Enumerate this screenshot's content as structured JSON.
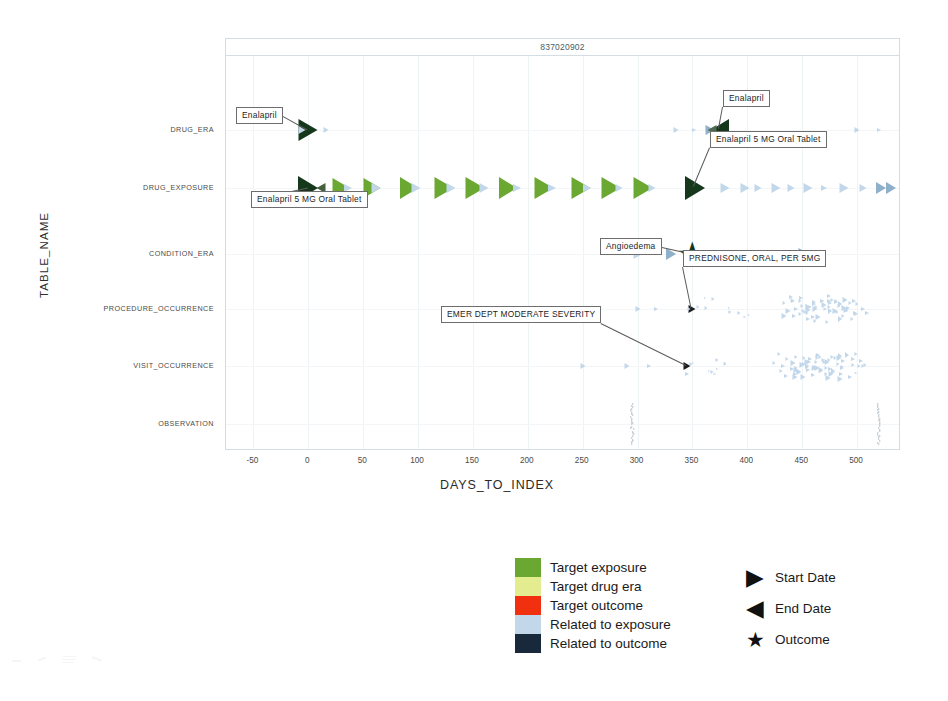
{
  "chart_data": {
    "type": "scatter",
    "title": "837020902",
    "xlabel": "DAYS_TO_INDEX",
    "ylabel": "TABLE_NAME",
    "xlim": [
      -75,
      540
    ],
    "xticks": [
      -50,
      0,
      50,
      100,
      150,
      200,
      250,
      300,
      350,
      400,
      450,
      500
    ],
    "categories": [
      "DRUG_ERA",
      "DRUG_EXPOSURE",
      "CONDITION_ERA",
      "PROCEDURE_OCCURRENCE",
      "VISIT_OCCURRENCE",
      "OBSERVATION"
    ],
    "grid": true,
    "legend_position": "below-center",
    "colors": {
      "target_exposure": "#6aa832",
      "target_drug_era": "#e4ec90",
      "target_outcome": "#f0300f",
      "related_to_exposure": "#c3d7ea",
      "related_to_outcome": "#17293a",
      "dark_marker": "#15381c"
    },
    "series": [
      {
        "name": "DRUG_ERA",
        "row": "DRUG_ERA",
        "points": [
          {
            "x": 0,
            "shape": "start",
            "color": "#15381c",
            "size": 19
          },
          {
            "x": -6,
            "shape": "start",
            "color": "#c3d7ea",
            "size": 7
          },
          {
            "x": 16,
            "shape": "start",
            "color": "#c3d7ea",
            "size": 5
          },
          {
            "x": 335,
            "shape": "start",
            "color": "#c3d7ea",
            "size": 5
          },
          {
            "x": 351,
            "shape": "start",
            "color": "#c3d7ea",
            "size": 4
          },
          {
            "x": 366,
            "shape": "start",
            "color": "#8fb0c9",
            "size": 9
          },
          {
            "x": 375,
            "shape": "end",
            "color": "#15381c",
            "size": 18
          },
          {
            "x": 368,
            "shape": "end",
            "color": "#516a52",
            "size": 9
          },
          {
            "x": 500,
            "shape": "start",
            "color": "#c3d7ea",
            "size": 5
          },
          {
            "x": 520,
            "shape": "start",
            "color": "#c3d7ea",
            "size": 4
          }
        ]
      },
      {
        "name": "DRUG_EXPOSURE",
        "row": "DRUG_EXPOSURE",
        "points": [
          {
            "x": 0,
            "shape": "start",
            "color": "#15381c",
            "size": 20
          },
          {
            "x": 12,
            "shape": "end",
            "color": "#46603f",
            "size": 9
          },
          {
            "x": 30,
            "shape": "start",
            "color": "#6aa832",
            "size": 17
          },
          {
            "x": 36,
            "shape": "start",
            "color": "#c3d7ea",
            "size": 8
          },
          {
            "x": 58,
            "shape": "start",
            "color": "#6aa832",
            "size": 17
          },
          {
            "x": 62,
            "shape": "start",
            "color": "#c3d7ea",
            "size": 9
          },
          {
            "x": 92,
            "shape": "start",
            "color": "#6aa832",
            "size": 18
          },
          {
            "x": 98,
            "shape": "start",
            "color": "#c3d7ea",
            "size": 9
          },
          {
            "x": 124,
            "shape": "start",
            "color": "#6aa832",
            "size": 19
          },
          {
            "x": 130,
            "shape": "start",
            "color": "#c3d7ea",
            "size": 9
          },
          {
            "x": 152,
            "shape": "start",
            "color": "#6aa832",
            "size": 19
          },
          {
            "x": 160,
            "shape": "start",
            "color": "#c3d7ea",
            "size": 9
          },
          {
            "x": 182,
            "shape": "start",
            "color": "#6aa832",
            "size": 18
          },
          {
            "x": 190,
            "shape": "start",
            "color": "#c3d7ea",
            "size": 8
          },
          {
            "x": 215,
            "shape": "start",
            "color": "#6aa832",
            "size": 19
          },
          {
            "x": 222,
            "shape": "start",
            "color": "#c3d7ea",
            "size": 8
          },
          {
            "x": 248,
            "shape": "start",
            "color": "#6aa832",
            "size": 19
          },
          {
            "x": 254,
            "shape": "start",
            "color": "#c3d7ea",
            "size": 8
          },
          {
            "x": 276,
            "shape": "start",
            "color": "#6aa832",
            "size": 19
          },
          {
            "x": 283,
            "shape": "start",
            "color": "#c3d7ea",
            "size": 7
          },
          {
            "x": 305,
            "shape": "start",
            "color": "#6aa832",
            "size": 19
          },
          {
            "x": 313,
            "shape": "start",
            "color": "#c3d7ea",
            "size": 7
          },
          {
            "x": 352,
            "shape": "start",
            "color": "#15381c",
            "size": 20
          },
          {
            "x": 380,
            "shape": "start",
            "color": "#c3d7ea",
            "size": 9
          },
          {
            "x": 398,
            "shape": "start",
            "color": "#c3d7ea",
            "size": 9
          },
          {
            "x": 410,
            "shape": "start",
            "color": "#c3d7ea",
            "size": 7
          },
          {
            "x": 426,
            "shape": "start",
            "color": "#c3d7ea",
            "size": 9
          },
          {
            "x": 440,
            "shape": "start",
            "color": "#c3d7ea",
            "size": 7
          },
          {
            "x": 455,
            "shape": "start",
            "color": "#c3d7ea",
            "size": 9
          },
          {
            "x": 470,
            "shape": "start",
            "color": "#c3d7ea",
            "size": 6
          },
          {
            "x": 488,
            "shape": "start",
            "color": "#c3d7ea",
            "size": 9
          },
          {
            "x": 505,
            "shape": "start",
            "color": "#c3d7ea",
            "size": 7
          },
          {
            "x": 522,
            "shape": "start",
            "color": "#8fb0c9",
            "size": 10
          },
          {
            "x": 531,
            "shape": "start",
            "color": "#8fb0c9",
            "size": 10
          }
        ]
      },
      {
        "name": "CONDITION_ERA",
        "row": "CONDITION_ERA",
        "points": [
          {
            "x": 300,
            "shape": "start",
            "color": "#c3d7ea",
            "size": 9
          },
          {
            "x": 330,
            "shape": "start",
            "color": "#8fb0c9",
            "size": 10
          },
          {
            "x": 350,
            "shape": "outcome",
            "color": "#15381c",
            "size": 22
          },
          {
            "x": 430,
            "shape": "start",
            "color": "#c3d7ea",
            "size": 6
          },
          {
            "x": 452,
            "shape": "start",
            "color": "#8fb0c9",
            "size": 11
          }
        ]
      },
      {
        "name": "PROCEDURE_OCCURRENCE",
        "row": "PROCEDURE_OCCURRENCE",
        "points": [
          {
            "x": 350,
            "shape": "start",
            "color": "#1c1c1c",
            "size": 7
          },
          {
            "x": 255,
            "shape": "start",
            "color": "#c3d7ea",
            "size": 5
          },
          {
            "x": 300,
            "shape": "start",
            "color": "#c3d7ea",
            "size": 5
          },
          {
            "x": 317,
            "shape": "start",
            "color": "#c3d7ea",
            "size": 4
          }
        ],
        "cluster": {
          "x_center": 470,
          "x_spread": 55,
          "count": 60,
          "color": "#c3d7ea"
        }
      },
      {
        "name": "VISIT_OCCURRENCE",
        "row": "VISIT_OCCURRENCE",
        "points": [
          {
            "x": 345,
            "shape": "start",
            "color": "#1c1c1c",
            "size": 7
          },
          {
            "x": 250,
            "shape": "start",
            "color": "#c3d7ea",
            "size": 5
          },
          {
            "x": 290,
            "shape": "start",
            "color": "#c3d7ea",
            "size": 5
          },
          {
            "x": 310,
            "shape": "start",
            "color": "#c3d7ea",
            "size": 4
          }
        ],
        "cluster": {
          "x_center": 468,
          "x_spread": 58,
          "count": 70,
          "color": "#c3d7ea"
        }
      },
      {
        "name": "OBSERVATION",
        "row": "OBSERVATION",
        "points": [],
        "stacks": [
          {
            "x": 295,
            "count": 26,
            "color": "#bcc6cd"
          },
          {
            "x": 520,
            "count": 26,
            "color": "#bcc6cd"
          }
        ]
      }
    ],
    "annotations": [
      {
        "label": "Enalapril",
        "row": "DRUG_ERA",
        "x": 0,
        "box_left": 236,
        "box_top": 107
      },
      {
        "label": "Enalapril 5 MG Oral Tablet",
        "row": "DRUG_EXPOSURE",
        "x": 0,
        "box_left": 251,
        "box_top": 191
      },
      {
        "label": "Enalapril",
        "row": "DRUG_ERA",
        "x": 375,
        "box_left": 723,
        "box_top": 90
      },
      {
        "label": "Enalapril 5 MG Oral Tablet",
        "row": "DRUG_EXPOSURE",
        "x": 352,
        "box_left": 710,
        "box_top": 131
      },
      {
        "label": "Angioedema",
        "row": "CONDITION_ERA",
        "x": 350,
        "box_left": 600,
        "box_top": 238
      },
      {
        "label": "PREDNISONE, ORAL, PER 5MG",
        "row": "PROCEDURE_OCCURRENCE",
        "x": 350,
        "box_left": 683,
        "box_top": 250
      },
      {
        "label": "EMER DEPT MODERATE SEVERITY",
        "row": "VISIT_OCCURRENCE",
        "x": 345,
        "box_left": 441,
        "box_top": 306
      }
    ],
    "legend": {
      "color_items": [
        {
          "label": "Target exposure",
          "color": "#6aa832"
        },
        {
          "label": "Target drug era",
          "color": "#e4ec90"
        },
        {
          "label": "Target outcome",
          "color": "#f0300f"
        },
        {
          "label": "Related to exposure",
          "color": "#c3d7ea"
        },
        {
          "label": "Related to outcome",
          "color": "#17293a"
        }
      ],
      "shape_items": [
        {
          "label": "Start Date",
          "glyph": "start-date-icon",
          "symbol": "▶"
        },
        {
          "label": "End Date",
          "glyph": "end-date-icon",
          "symbol": "◀"
        },
        {
          "label": "Outcome",
          "glyph": "outcome-star-icon",
          "symbol": "★"
        }
      ]
    }
  }
}
